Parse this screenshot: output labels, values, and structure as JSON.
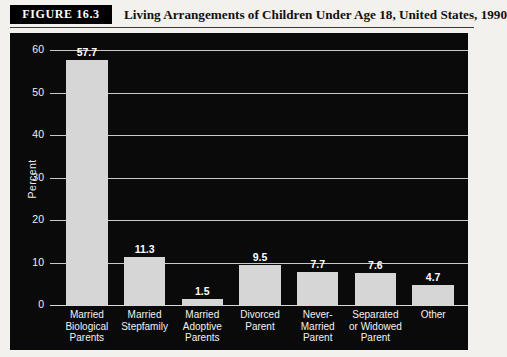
{
  "figure": {
    "tag": "FIGURE 16.3",
    "title": "Living Arrangements of Children Under Age 18, United States, 1990"
  },
  "colors": {
    "panel_background": "#0a0a0a",
    "bar_fill": "#d6d6d6",
    "grid": "#c9c9c9",
    "text_light": "#f2f2f2",
    "page_background": "#f2f1ee"
  },
  "chart_data": {
    "type": "bar",
    "title": "Living Arrangements of Children Under Age 18, United States, 1990",
    "xlabel": "",
    "ylabel": "Percent",
    "ylim": [
      0,
      60
    ],
    "yticks": [
      0,
      10,
      20,
      30,
      40,
      50,
      60
    ],
    "grid": true,
    "legend": false,
    "categories": [
      "Married Biological Parents",
      "Married Stepfamily",
      "Married Adoptive Parents",
      "Divorced Parent",
      "Never-Married Parent",
      "Separated or Widowed Parent",
      "Other"
    ],
    "category_lines": [
      [
        "Married",
        "Biological",
        "Parents"
      ],
      [
        "Married",
        "Stepfamily"
      ],
      [
        "Married",
        "Adoptive",
        "Parents"
      ],
      [
        "Divorced",
        "Parent"
      ],
      [
        "Never-",
        "Married",
        "Parent"
      ],
      [
        "Separated",
        "or Widowed",
        "Parent"
      ],
      [
        "Other"
      ]
    ],
    "values": [
      57.7,
      11.3,
      1.5,
      9.5,
      7.7,
      7.6,
      4.7
    ],
    "value_labels": [
      "57.7",
      "11.3",
      "1.5",
      "9.5",
      "7.7",
      "7.6",
      "4.7"
    ]
  },
  "axis": {
    "tick_labels": [
      "60",
      "50",
      "40",
      "30",
      "20",
      "10",
      "0"
    ]
  }
}
